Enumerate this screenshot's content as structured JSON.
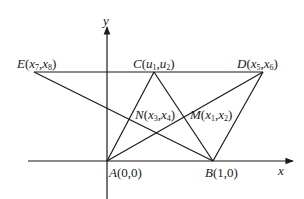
{
  "diagram": {
    "stroke_color": "#1a1a1a",
    "background": "#ffffff",
    "axes": {
      "x_label": "x",
      "y_label": "y"
    },
    "points": {
      "A": {
        "name": "A",
        "coords": "(0,0)"
      },
      "B": {
        "name": "B",
        "coords": "(1,0)"
      },
      "C": {
        "name": "C",
        "x": "u",
        "x_sub": "1",
        "y": "u",
        "y_sub": "2"
      },
      "D": {
        "name": "D",
        "x": "x",
        "x_sub": "5",
        "y": "x",
        "y_sub": "6"
      },
      "E": {
        "name": "E",
        "x": "x",
        "x_sub": "7",
        "y": "x",
        "y_sub": "8"
      },
      "M": {
        "name": "M",
        "x": "x",
        "x_sub": "1",
        "y": "x",
        "y_sub": "2"
      },
      "N": {
        "name": "N",
        "x": "x",
        "x_sub": "3",
        "y": "x",
        "y_sub": "4"
      }
    },
    "segments": [
      "E-D",
      "E-B",
      "A-D",
      "A-C",
      "C-B",
      "B-D"
    ]
  }
}
